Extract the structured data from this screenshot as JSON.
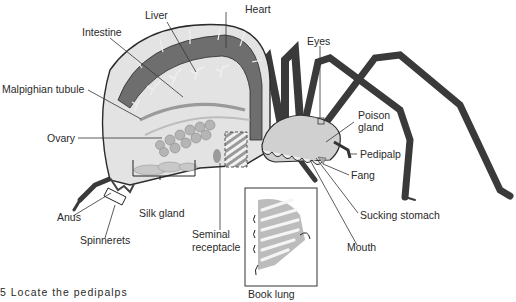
{
  "figure": {
    "caption_fragment": "5 Locate the pedipalps",
    "inset_label": "Book lung"
  },
  "labels": [
    {
      "id": "heart",
      "text": "Heart",
      "x": 245,
      "y": 4
    },
    {
      "id": "liver",
      "text": "Liver",
      "x": 145,
      "y": 10
    },
    {
      "id": "intestine",
      "text": "Intestine",
      "x": 82,
      "y": 27
    },
    {
      "id": "eyes",
      "text": "Eyes",
      "x": 307,
      "y": 36
    },
    {
      "id": "malpighian-tubule",
      "text": "Malpighian tubule",
      "x": 2,
      "y": 84
    },
    {
      "id": "ovary",
      "text": "Ovary",
      "x": 47,
      "y": 133
    },
    {
      "id": "poison-gland-1",
      "text": "Poison",
      "x": 358,
      "y": 110
    },
    {
      "id": "poison-gland-2",
      "text": "gland",
      "x": 358,
      "y": 122
    },
    {
      "id": "pedipalp",
      "text": "Pedipalp",
      "x": 360,
      "y": 149
    },
    {
      "id": "fang",
      "text": "Fang",
      "x": 351,
      "y": 170
    },
    {
      "id": "sucking-stomach",
      "text": "Sucking stomach",
      "x": 360,
      "y": 210
    },
    {
      "id": "mouth",
      "text": "Mouth",
      "x": 347,
      "y": 242
    },
    {
      "id": "anus",
      "text": "Anus",
      "x": 57,
      "y": 212
    },
    {
      "id": "silk-gland",
      "text": "Silk gland",
      "x": 139,
      "y": 208
    },
    {
      "id": "spinnerets",
      "text": "Spinnerets",
      "x": 80,
      "y": 235
    },
    {
      "id": "seminal-receptacle-1",
      "text": "Seminal",
      "x": 192,
      "y": 229
    },
    {
      "id": "seminal-receptacle-2",
      "text": "receptacle",
      "x": 192,
      "y": 242
    },
    {
      "id": "book-lung",
      "text": "Book lung",
      "x": 248,
      "y": 289
    }
  ],
  "colors": {
    "body_outline": "#2b2b2b",
    "heart_band": "#6e6e6e",
    "body_fill": "#d9d9d9",
    "light_fill": "#ececec",
    "leg": "#3a3a3a",
    "text": "#2a2a2a",
    "leader": "#333333"
  }
}
